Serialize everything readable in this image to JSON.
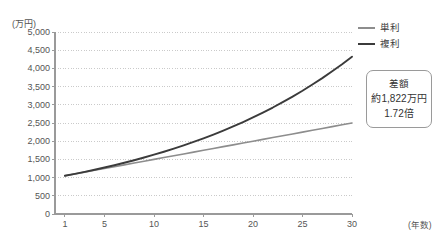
{
  "chart_data": {
    "type": "line",
    "title": "",
    "subtitle": "",
    "xlabel": "(年数)",
    "ylabel": "(万円)",
    "x": [
      1,
      2,
      3,
      4,
      5,
      6,
      7,
      8,
      9,
      10,
      11,
      12,
      13,
      14,
      15,
      16,
      17,
      18,
      19,
      20,
      21,
      22,
      23,
      24,
      25,
      26,
      27,
      28,
      29,
      30
    ],
    "xlim": [
      0,
      30
    ],
    "ylim": [
      0,
      5000
    ],
    "ytick_step": 500,
    "grid": "horizontal-dotted",
    "legend_position": "top-right",
    "series": [
      {
        "name": "単利",
        "color": "#8d8d8d",
        "values": [
          1050,
          1100,
          1150,
          1200,
          1250,
          1300,
          1350,
          1400,
          1450,
          1500,
          1550,
          1600,
          1650,
          1700,
          1750,
          1800,
          1850,
          1900,
          1950,
          2000,
          2050,
          2100,
          2150,
          2200,
          2250,
          2300,
          2350,
          2400,
          2450,
          2500
        ]
      },
      {
        "name": "複利",
        "color": "#3b3b3b",
        "values": [
          1050,
          1103,
          1158,
          1216,
          1276,
          1340,
          1407,
          1477,
          1551,
          1629,
          1710,
          1796,
          1886,
          1980,
          2079,
          2183,
          2292,
          2407,
          2527,
          2653,
          2786,
          2925,
          3072,
          3225,
          3386,
          3556,
          3733,
          3920,
          4116,
          4322
        ]
      }
    ],
    "ytick_labels": [
      "5,000",
      "4,500",
      "4,000",
      "3,500",
      "3,000",
      "2,500",
      "2,000",
      "1,500",
      "1,000",
      "500",
      "0"
    ],
    "ytick_values": [
      5000,
      4500,
      4000,
      3500,
      3000,
      2500,
      2000,
      1500,
      1000,
      500,
      0
    ],
    "xtick_labels": [
      "1",
      "5",
      "10",
      "15",
      "20",
      "25",
      "30"
    ],
    "xtick_values": [
      1,
      5,
      10,
      15,
      20,
      25,
      30
    ],
    "annotations": [
      {
        "name": "difference-callout",
        "lines": [
          "差額",
          "約1,822万円",
          "1.72倍"
        ]
      }
    ]
  },
  "legend": {
    "items": [
      {
        "label": "単利",
        "color": "#8d8d8d"
      },
      {
        "label": "複利",
        "color": "#3b3b3b"
      }
    ]
  },
  "callout": {
    "line1": "差額",
    "line2": "約1,822万円",
    "line3": "1.72倍"
  },
  "axes": {
    "y_unit": "(万円)",
    "x_unit": "(年数)"
  }
}
